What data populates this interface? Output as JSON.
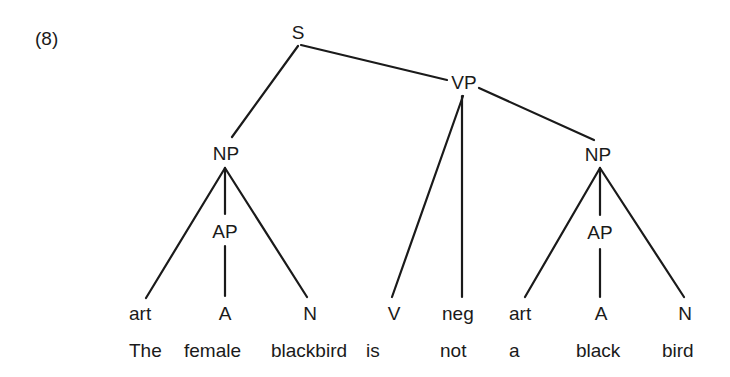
{
  "example_number": "(8)",
  "tree": {
    "root": "S",
    "nodes": {
      "s": "S",
      "vp": "VP",
      "np_subject": "NP",
      "ap_subject": "AP",
      "np_object": "NP",
      "ap_object": "AP"
    },
    "categories": [
      "art",
      "A",
      "N",
      "V",
      "neg",
      "art",
      "A",
      "N"
    ],
    "words": [
      "The",
      "female",
      "blackbird",
      "is",
      "not",
      "a",
      "black",
      "bird"
    ]
  },
  "structure": {
    "S": [
      "NP",
      "VP"
    ],
    "NP_subject": [
      "art",
      "AP",
      "N"
    ],
    "AP_subject": [
      "A"
    ],
    "VP": [
      "V",
      "neg",
      "NP"
    ],
    "NP_object": [
      "art",
      "AP",
      "N"
    ],
    "AP_object": [
      "A"
    ]
  }
}
